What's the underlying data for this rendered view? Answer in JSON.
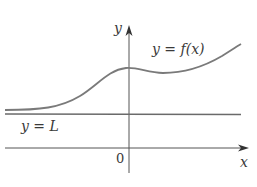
{
  "diagram": {
    "axes": {
      "x_label": "x",
      "y_label": "y",
      "origin_label": "0"
    },
    "curve": {
      "label": "y = f(x)",
      "color": "#7a7a7a"
    },
    "asymptote": {
      "label": "y = L",
      "color": "#6a6a6a"
    },
    "axis_color": "#555555",
    "text_color": "#3a3a3a"
  }
}
